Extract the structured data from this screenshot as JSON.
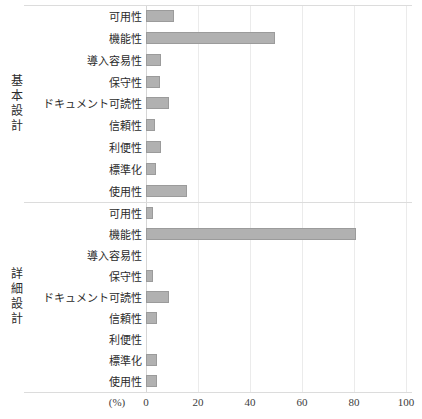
{
  "chart_data": {
    "type": "bar",
    "orientation": "horizontal",
    "title": "",
    "xlabel": "(%)",
    "ylabel": "",
    "xlim": [
      0,
      100
    ],
    "x_ticks": [
      0,
      20,
      40,
      60,
      80,
      100
    ],
    "grid": true,
    "legend": "none",
    "bar_color": "#b1b1b1",
    "bar_border_color": "#9b9b9b",
    "categories": [
      "可用性",
      "機能性",
      "導入容易性",
      "保守性",
      "ドキュメント可読性",
      "信頼性",
      "利便性",
      "標準化",
      "使用性"
    ],
    "series": [
      {
        "name": "基本設計",
        "values": [
          10,
          49,
          5,
          4.5,
          8,
          2.5,
          5,
          3,
          15
        ]
      },
      {
        "name": "詳細設計",
        "values": [
          2,
          80,
          0,
          2,
          8,
          3.5,
          0,
          3.5,
          3.5
        ]
      }
    ]
  }
}
